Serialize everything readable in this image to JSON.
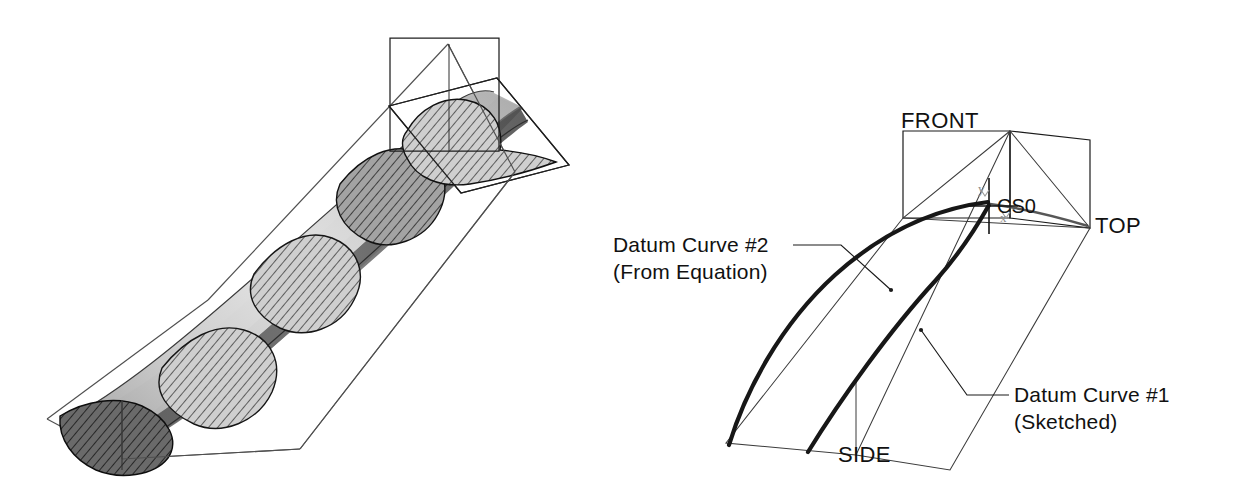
{
  "figure": {
    "background": "#ffffff",
    "line_color": "#1a1a1a",
    "thick_curve_color": "#171717",
    "panels": [
      {
        "id": "left",
        "name": "swept-surface-model"
      },
      {
        "id": "right",
        "name": "datum-curve-layout"
      }
    ]
  },
  "left_panel": {
    "name": "swept-blade-surface",
    "description": "Shaded twisted blade surface swept along a trajectory, shown inside a wireframe bounding prism with intersecting datum planes at the upper end.",
    "surface": {
      "light_shade": "#dcdcdc",
      "mid_shade": "#b4b4b4",
      "dark_shade": "#6e6e6e",
      "darkest_shade": "#4a4a4a",
      "section_count": 5,
      "section_fill": "#c8c8c8",
      "section_hatch_color": "#202020",
      "section_shape": "airfoil-teardrop"
    },
    "wireframe": {
      "prism_stroke": "#4a4a4a",
      "plane_stroke": "#2a2a2a",
      "planes": [
        "vertical-datum-plane",
        "horizontal-datum-plane"
      ]
    }
  },
  "right_panel": {
    "name": "datum-curve-layout",
    "planes": [
      {
        "key": "front",
        "label": "FRONT"
      },
      {
        "key": "top",
        "label": "TOP"
      },
      {
        "key": "side",
        "label": "SIDE"
      }
    ],
    "coordinate_system": {
      "label": "CS0",
      "axis_glyph_x": "x",
      "axis_glyph_y": "y"
    },
    "curves": [
      {
        "key": "curve2",
        "label_line1": "Datum Curve #2",
        "label_line2": "(From Equation)"
      },
      {
        "key": "curve1",
        "label_line1": "Datum Curve #1",
        "label_line2": "(Sketched)"
      }
    ]
  }
}
